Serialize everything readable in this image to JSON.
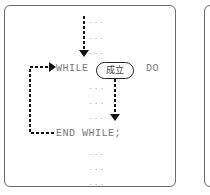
{
  "diagram": {
    "keywords": {
      "while": "WHILE",
      "do": "DO",
      "end_while": "END WHILE;"
    },
    "condition_label": "成立",
    "ellipsis": "...",
    "arrows": [
      {
        "from": "top",
        "to": "WHILE line",
        "style": "dashed"
      },
      {
        "from": "condition",
        "to": "loop body end",
        "style": "dashed"
      },
      {
        "from": "END WHILE",
        "to": "WHILE",
        "style": "dashed",
        "label": "loop back"
      }
    ]
  }
}
